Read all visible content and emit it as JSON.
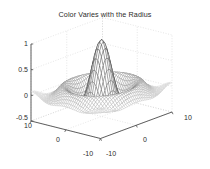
{
  "figure": {
    "title": "Color Varies with the Radius",
    "background_color": "#ffffff",
    "axis_color": "#4d4d4d",
    "grid_color": "#c8c8c8",
    "text_color": "#2b2b2b",
    "mesh_color_light": "#b4b4b4",
    "mesh_color_dark": "#1a1a1a"
  },
  "axes": {
    "z_ticks": [
      {
        "label": "1",
        "value": 1
      },
      {
        "label": "0.5",
        "value": 0.5
      },
      {
        "label": "0",
        "value": 0
      },
      {
        "label": "-0.5",
        "value": -0.5
      }
    ],
    "left_ticks": [
      {
        "label": "10",
        "value": 10
      },
      {
        "label": "0",
        "value": 0
      },
      {
        "label": "-10",
        "value": -10
      }
    ],
    "right_ticks": [
      {
        "label": "-10",
        "value": -10
      },
      {
        "label": "0",
        "value": 0
      },
      {
        "label": "10",
        "value": 10
      }
    ]
  },
  "chart_data": {
    "type": "surface",
    "title": "Color Varies with the Radius",
    "xlabel": "",
    "ylabel": "",
    "zlabel": "",
    "function": "sin(r)/r  where r = sqrt(x^2 + y^2)",
    "xlim": [
      -10,
      10
    ],
    "ylim": [
      -10,
      10
    ],
    "zlim": [
      -0.5,
      1
    ],
    "xticks": [
      -10,
      0,
      10
    ],
    "yticks": [
      -10,
      0,
      10
    ],
    "zticks": [
      -0.5,
      0,
      0.5,
      1
    ],
    "grid": true,
    "legend": false,
    "colormap": "gray",
    "mesh_resolution": 41,
    "view_azimuth": -37.5,
    "view_elevation": 30,
    "peak_value": 1.0,
    "peak_at": [
      0,
      0
    ],
    "ring_minimum": -0.217,
    "samples": [
      {
        "r": 0.0,
        "z": 1.0
      },
      {
        "r": 1.0,
        "z": 0.841
      },
      {
        "r": 2.0,
        "z": 0.455
      },
      {
        "r": 3.0,
        "z": 0.047
      },
      {
        "r": 4.0,
        "z": -0.189
      },
      {
        "r": 4.493,
        "z": -0.217
      },
      {
        "r": 5.0,
        "z": -0.192
      },
      {
        "r": 6.0,
        "z": -0.047
      },
      {
        "r": 7.0,
        "z": 0.094
      },
      {
        "r": 7.725,
        "z": 0.128
      },
      {
        "r": 9.0,
        "z": 0.046
      },
      {
        "r": 10.0,
        "z": -0.054
      },
      {
        "r": 12.0,
        "z": -0.045
      },
      {
        "r": 14.14,
        "z": 0.07
      }
    ]
  }
}
